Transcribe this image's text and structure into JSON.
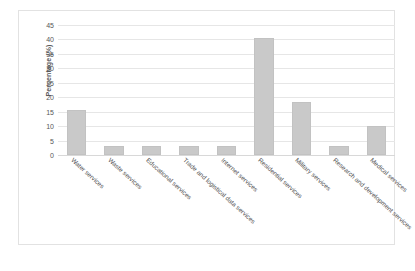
{
  "chart_data": {
    "type": "bar",
    "title": "",
    "subtitle": "",
    "xlabel": "",
    "ylabel": "Percentage (%)",
    "ylim": [
      0,
      45
    ],
    "ytick_step": 5,
    "yticks": [
      0,
      5,
      10,
      15,
      20,
      25,
      30,
      35,
      40,
      45
    ],
    "ytick_labels": [
      "0",
      "5",
      "10",
      "15",
      "20",
      "25",
      "30",
      "35",
      "40",
      "45"
    ],
    "grid": "horizontal",
    "legend": "none",
    "bar_color": "#c9c9c9",
    "gridline_color": "#e6e6e6",
    "axis_text_color": "#585858",
    "categories": [
      "Water services",
      "Waste services",
      "Educational services",
      "Trade and logistical data services",
      "Internet services",
      "Residential services",
      "Military services",
      "Research and development services",
      "Medical services"
    ],
    "values": [
      15.5,
      3,
      3,
      3,
      3,
      40.5,
      18.5,
      3,
      10
    ]
  }
}
